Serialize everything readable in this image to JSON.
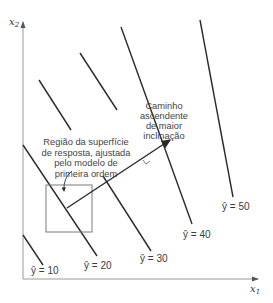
{
  "axes": {
    "x_label": "x",
    "x_sub": "1",
    "y_label": "x",
    "y_sub": "2"
  },
  "contours": [
    {
      "label": "ŷ = 10",
      "value": 10
    },
    {
      "label": "ŷ = 20",
      "value": 20
    },
    {
      "label": "ŷ = 30",
      "value": 30
    },
    {
      "label": "ŷ = 40",
      "value": 40
    },
    {
      "label": "ŷ = 50",
      "value": 50
    }
  ],
  "annotations": {
    "region": {
      "lines": [
        "Região da superfície",
        "de resposta, ajustada",
        "pelo modelo de",
        "primeira ordem"
      ]
    },
    "path": {
      "lines": [
        "Caminho",
        "ascendente",
        "de maior",
        "inclinação"
      ]
    }
  },
  "colors": {
    "line": "#2a2a2a",
    "axis": "#9a9a9a",
    "box": "#7a7a7a",
    "text": "#444444"
  }
}
